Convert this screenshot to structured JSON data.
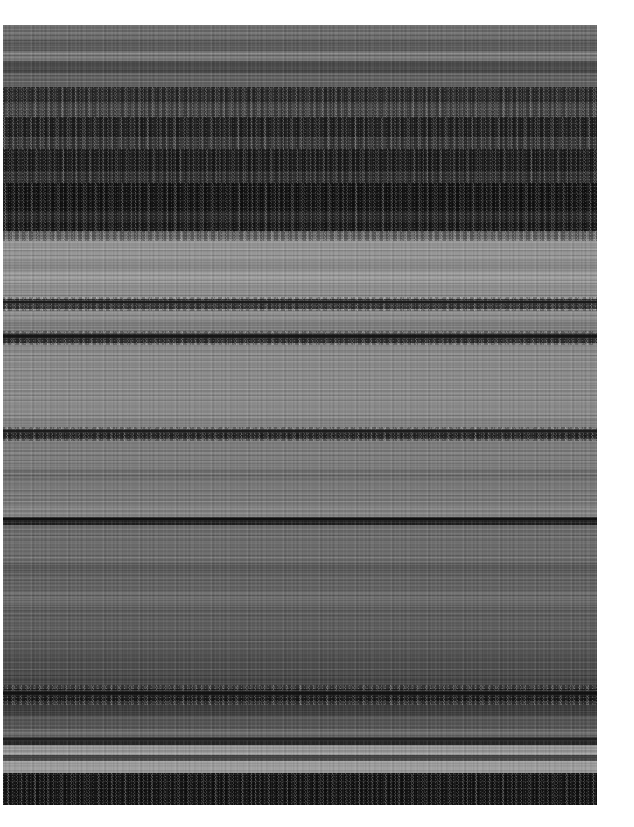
{
  "image": {
    "kind": "spectrogram-texture",
    "description": "Grayscale horizontally-banded spectrogram / noise texture",
    "canvas": {
      "width": 634,
      "height": 827,
      "background": "#ffffff"
    },
    "plate": {
      "x": 3,
      "y": 25,
      "width": 594,
      "height": 780
    },
    "palette": {
      "white_margin": "#ffffff",
      "darkest": "#0e0e0e",
      "very_dark": "#1a1a1a",
      "dark": "#2c2c2c",
      "mid_dark": "#4e4e4e",
      "mid": "#6a6a6a",
      "mid_light": "#808080",
      "light": "#8c8c8c",
      "lighter": "#969696",
      "lightest": "#a4a4a4"
    }
  },
  "chart_data": {
    "type": "heatmap",
    "title": "",
    "subtitle": "",
    "xlabel": "",
    "ylabel": "",
    "grid": false,
    "legend": "none",
    "colormap": "grayscale",
    "orientation": "horizontal-bands",
    "xlim": [
      0,
      594
    ],
    "ylim": [
      0,
      780
    ],
    "tick_labels_x": [],
    "tick_labels_y": [],
    "annotations": [],
    "note": "Intensity varies only along the vertical axis; each row is a quasi-uniform horizontal band of speckled noise.",
    "bands": [
      {
        "start": 0,
        "end": 14,
        "color": "#6e6e6e",
        "texture": "fine",
        "label": "band-01"
      },
      {
        "start": 14,
        "end": 26,
        "color": "#5c5c5c",
        "texture": "fine",
        "label": "band-02"
      },
      {
        "start": 26,
        "end": 36,
        "color": "#7a7a7a",
        "texture": "fine",
        "label": "band-03"
      },
      {
        "start": 36,
        "end": 48,
        "color": "#4a4a4a",
        "texture": "streak",
        "label": "band-04"
      },
      {
        "start": 48,
        "end": 62,
        "color": "#636363",
        "texture": "fine",
        "label": "band-05"
      },
      {
        "start": 62,
        "end": 78,
        "color": "#2e2e2e",
        "texture": "mottle",
        "label": "band-06"
      },
      {
        "start": 78,
        "end": 92,
        "color": "#4d4d4d",
        "texture": "streak",
        "label": "band-07"
      },
      {
        "start": 92,
        "end": 112,
        "color": "#232323",
        "texture": "mottle",
        "label": "band-08"
      },
      {
        "start": 112,
        "end": 124,
        "color": "#3e3e3e",
        "texture": "streak",
        "label": "band-09"
      },
      {
        "start": 124,
        "end": 146,
        "color": "#1d1d1d",
        "texture": "mottle",
        "label": "band-10"
      },
      {
        "start": 146,
        "end": 158,
        "color": "#333333",
        "texture": "streak",
        "label": "band-11"
      },
      {
        "start": 158,
        "end": 186,
        "color": "#141414",
        "texture": "mottle",
        "label": "band-12"
      },
      {
        "start": 186,
        "end": 196,
        "color": "#2a2a2a",
        "texture": "streak",
        "label": "band-13"
      },
      {
        "start": 196,
        "end": 206,
        "color": "#1a1a1a",
        "texture": "mottle",
        "label": "band-14"
      },
      {
        "start": 206,
        "end": 214,
        "color": "#6f6f6f",
        "texture": "streak",
        "label": "band-15"
      },
      {
        "start": 214,
        "end": 236,
        "color": "#969696",
        "texture": "fine",
        "label": "band-16"
      },
      {
        "start": 236,
        "end": 246,
        "color": "#8a8a8a",
        "texture": "fine",
        "label": "band-17"
      },
      {
        "start": 246,
        "end": 258,
        "color": "#9c9c9c",
        "texture": "fine",
        "label": "band-18"
      },
      {
        "start": 258,
        "end": 274,
        "color": "#909090",
        "texture": "fine",
        "label": "band-19"
      },
      {
        "start": 274,
        "end": 284,
        "color": "#3a3a3a",
        "texture": "ridge",
        "label": "band-20"
      },
      {
        "start": 284,
        "end": 296,
        "color": "#8e8e8e",
        "texture": "fine",
        "label": "band-21"
      },
      {
        "start": 296,
        "end": 308,
        "color": "#7e7e7e",
        "texture": "streak",
        "label": "band-22"
      },
      {
        "start": 308,
        "end": 318,
        "color": "#2f2f2f",
        "texture": "ridge",
        "label": "band-23"
      },
      {
        "start": 318,
        "end": 330,
        "color": "#8a8a8a",
        "texture": "fine",
        "label": "band-24"
      },
      {
        "start": 330,
        "end": 392,
        "color": "#8c8c8c",
        "texture": "fine",
        "label": "band-25"
      },
      {
        "start": 392,
        "end": 404,
        "color": "#848484",
        "texture": "fine",
        "label": "band-26"
      },
      {
        "start": 404,
        "end": 414,
        "color": "#2b2b2b",
        "texture": "ridge",
        "label": "band-27"
      },
      {
        "start": 414,
        "end": 444,
        "color": "#7e7e7e",
        "texture": "fine",
        "label": "band-28"
      },
      {
        "start": 444,
        "end": 456,
        "color": "#707070",
        "texture": "streak",
        "label": "band-29"
      },
      {
        "start": 456,
        "end": 480,
        "color": "#7a7a7a",
        "texture": "fine",
        "label": "band-30"
      },
      {
        "start": 480,
        "end": 492,
        "color": "#858585",
        "texture": "streak",
        "label": "band-31"
      },
      {
        "start": 492,
        "end": 500,
        "color": "#1e1e1e",
        "texture": "ridge",
        "label": "band-32"
      },
      {
        "start": 500,
        "end": 538,
        "color": "#6d6d6d",
        "texture": "fine",
        "label": "band-33"
      },
      {
        "start": 538,
        "end": 548,
        "color": "#5a5a5a",
        "texture": "streak",
        "label": "band-34"
      },
      {
        "start": 548,
        "end": 566,
        "color": "#636363",
        "texture": "fine",
        "label": "band-35"
      },
      {
        "start": 566,
        "end": 580,
        "color": "#6c6c6c",
        "texture": "streak",
        "label": "band-36"
      },
      {
        "start": 580,
        "end": 612,
        "color": "#5e5e5e",
        "texture": "fine",
        "label": "band-37"
      },
      {
        "start": 612,
        "end": 628,
        "color": "#585858",
        "texture": "streak",
        "label": "band-38"
      },
      {
        "start": 628,
        "end": 650,
        "color": "#4e4e4e",
        "texture": "fine",
        "label": "band-39"
      },
      {
        "start": 650,
        "end": 664,
        "color": "#464646",
        "texture": "streak",
        "label": "band-40"
      },
      {
        "start": 664,
        "end": 676,
        "color": "#1c1c1c",
        "texture": "mottle",
        "label": "band-41"
      },
      {
        "start": 676,
        "end": 690,
        "color": "#3c3c3c",
        "texture": "streak",
        "label": "band-42"
      },
      {
        "start": 690,
        "end": 704,
        "color": "#555555",
        "texture": "fine",
        "label": "band-43"
      },
      {
        "start": 704,
        "end": 712,
        "color": "#6a6a6a",
        "texture": "streak",
        "label": "band-44"
      },
      {
        "start": 712,
        "end": 720,
        "color": "#262626",
        "texture": "ridge",
        "label": "band-45"
      },
      {
        "start": 720,
        "end": 730,
        "color": "#9a9a9a",
        "texture": "fine",
        "label": "band-46"
      },
      {
        "start": 730,
        "end": 736,
        "color": "#4a4a4a",
        "texture": "ridge",
        "label": "band-47"
      },
      {
        "start": 736,
        "end": 748,
        "color": "#a0a0a0",
        "texture": "fine",
        "label": "band-48"
      },
      {
        "start": 748,
        "end": 780,
        "color": "#141414",
        "texture": "mottle",
        "label": "band-49"
      }
    ],
    "ridges": [
      {
        "y": 277,
        "thickness": 5,
        "color": "#1b1b1b"
      },
      {
        "y": 311,
        "thickness": 6,
        "color": "#151515"
      },
      {
        "y": 406,
        "thickness": 5,
        "color": "#1c1c1c"
      },
      {
        "y": 494,
        "thickness": 4,
        "color": "#101010"
      },
      {
        "y": 668,
        "thickness": 7,
        "color": "#121212"
      },
      {
        "y": 714,
        "thickness": 4,
        "color": "#1e1e1e"
      },
      {
        "y": 732,
        "thickness": 3,
        "color": "#3a3a3a"
      }
    ],
    "speckle_regions": [
      {
        "start": 62,
        "end": 92
      },
      {
        "start": 92,
        "end": 124
      },
      {
        "start": 124,
        "end": 158
      },
      {
        "start": 158,
        "end": 206
      },
      {
        "start": 206,
        "end": 216
      },
      {
        "start": 272,
        "end": 286
      },
      {
        "start": 306,
        "end": 320
      },
      {
        "start": 402,
        "end": 416
      },
      {
        "start": 660,
        "end": 680
      },
      {
        "start": 748,
        "end": 780
      }
    ]
  }
}
